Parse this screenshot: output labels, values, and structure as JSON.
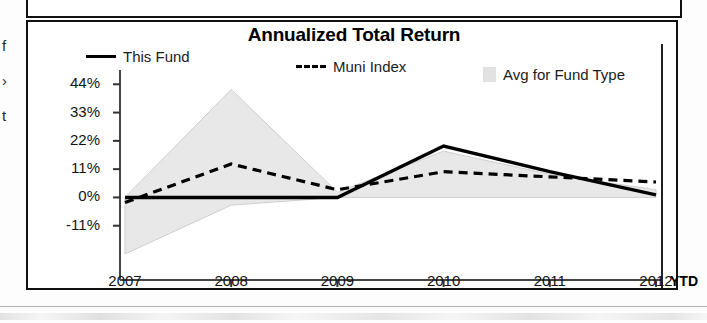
{
  "document": {
    "edge_fragments": [
      "f",
      "›",
      "t"
    ]
  },
  "chart_panel": {
    "title": "Annualized Total Return",
    "legend": [
      {
        "label": "This Fund",
        "style": "solid-line",
        "icon": "legend-solid-line-swatch"
      },
      {
        "label": "Muni Index",
        "style": "dashed-line",
        "icon": "legend-dashed-line-swatch",
        "prefix": "---"
      },
      {
        "label": "Avg for Fund Type",
        "style": "area-fill",
        "icon": "legend-gray-area-swatch"
      }
    ],
    "ytd_note": "YTD"
  },
  "chart_data": {
    "type": "line",
    "title": "Annualized Total Return",
    "xlabel": "",
    "ylabel": "",
    "categories": [
      "2007",
      "2008",
      "2009",
      "2010",
      "2011",
      "2012"
    ],
    "ytick_labels": [
      "44%",
      "33%",
      "22%",
      "11%",
      "0%",
      "-11%"
    ],
    "ytick_values": [
      44,
      33,
      22,
      11,
      0,
      -11
    ],
    "ylim": [
      -22,
      48
    ],
    "xlim_labels": [
      "2007",
      "2012"
    ],
    "grid": false,
    "legend_position": "top",
    "series": [
      {
        "name": "This Fund",
        "style": "solid",
        "color": "#000000",
        "values": [
          0,
          0,
          0,
          20,
          10,
          1
        ]
      },
      {
        "name": "Muni Index",
        "style": "dashed",
        "color": "#000000",
        "values": [
          -2,
          13,
          3,
          10,
          8,
          6
        ]
      },
      {
        "name": "Avg for Fund Type",
        "style": "filled-area",
        "color": "#e8e8e8",
        "upper": [
          0,
          42,
          2,
          18,
          9,
          3
        ],
        "lower": [
          -22,
          -3,
          0,
          0,
          0,
          0
        ]
      }
    ],
    "annotations": [
      {
        "text": "YTD",
        "x": "2012",
        "position": "axis-right",
        "bold": true
      }
    ]
  }
}
